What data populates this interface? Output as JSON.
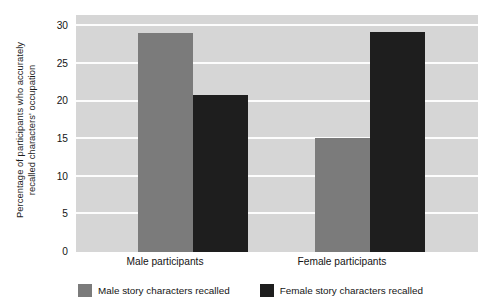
{
  "chart_data": {
    "type": "bar",
    "title": "",
    "subtitle": "",
    "xlabel": "",
    "ylabel": "Percentage of participants who accurately recalled characters' occupation",
    "ylabel_lines": [
      "Percentage of participants who accurately",
      "recalled characters' occupation"
    ],
    "categories": [
      "Male participants",
      "Female participants"
    ],
    "series": [
      {
        "name": "Male story characters recalled",
        "color": "#7b7b7b",
        "values": [
          29.1,
          15.1
        ]
      },
      {
        "name": "Female story characters recalled",
        "color": "#1e1e1e",
        "values": [
          20.9,
          29.2
        ]
      }
    ],
    "ylim": [
      0,
      31.5
    ],
    "yticks": [
      0,
      5,
      10,
      15,
      20,
      25,
      30
    ],
    "ytick_labels": [
      "0",
      "5",
      "10",
      "15",
      "20",
      "25",
      "30"
    ],
    "grid": "horizontal",
    "grid_color": "#fdfdfd",
    "plot_background": "#d6d6d6",
    "figure_background": "#ffffff",
    "legend_position": "bottom"
  },
  "legend": {
    "items": [
      {
        "label": "Male story characters recalled",
        "swatch": "legend-swatch-light"
      },
      {
        "label": "Female story characters recalled",
        "swatch": "legend-swatch-dark"
      }
    ]
  }
}
